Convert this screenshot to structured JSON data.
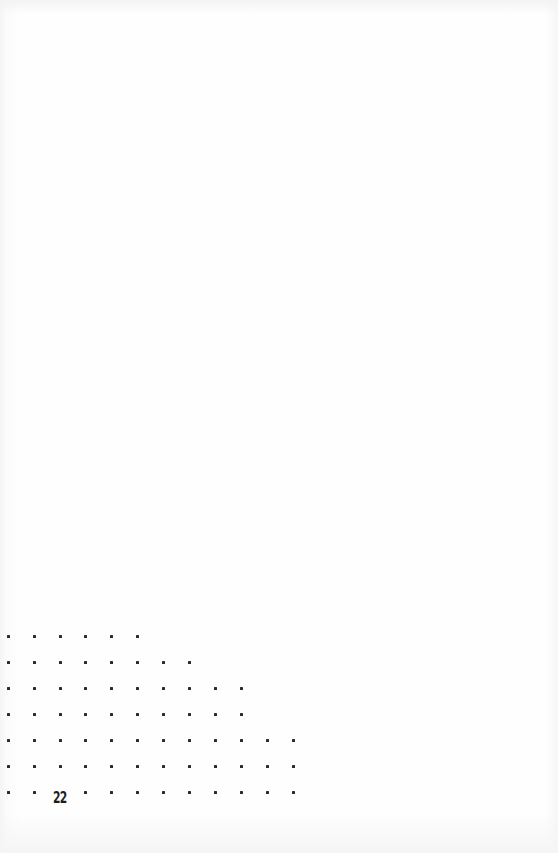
{
  "page": {
    "page_number": "22",
    "background_color": "#fdfdfd",
    "dot_color": "#2a2a2a"
  },
  "dot_grid": {
    "column_x": [
      8,
      34,
      60,
      85,
      111,
      137,
      163,
      189,
      215,
      241,
      267,
      293
    ],
    "rows": [
      {
        "y": 636,
        "count": 6
      },
      {
        "y": 662,
        "count": 8
      },
      {
        "y": 688,
        "count": 10
      },
      {
        "y": 714,
        "count": 10
      },
      {
        "y": 740,
        "count": 12
      },
      {
        "y": 766,
        "count": 12
      },
      {
        "y": 792,
        "count": 12,
        "skip_index": 2
      }
    ]
  }
}
